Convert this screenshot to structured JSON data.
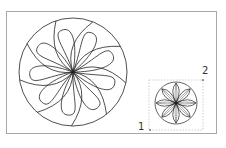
{
  "canvas": {
    "background": "#ffffff",
    "frame_color": "#a8a8a8"
  },
  "large_rosette": {
    "cx": 73,
    "cy": 72,
    "r": 54,
    "petals": 9,
    "stroke": "#222222"
  },
  "small_rosette": {
    "cx": 176,
    "cy": 103,
    "r": 21,
    "petals": 8,
    "stroke": "#222222"
  },
  "selection_box": {
    "x": 149,
    "y": 80,
    "w": 54,
    "h": 50,
    "color": "#b0b0b0"
  },
  "handles": [
    {
      "label": "1",
      "x": 150,
      "y": 130
    },
    {
      "label": "2",
      "x": 203,
      "y": 80
    }
  ]
}
